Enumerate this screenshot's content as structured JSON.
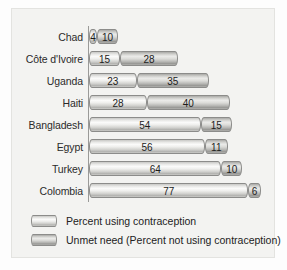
{
  "chart_data": {
    "type": "bar",
    "orientation": "horizontal",
    "stacked": true,
    "title": "",
    "subtitle": "",
    "xlabel": "",
    "ylabel": "",
    "xlim": [
      0,
      90
    ],
    "grid": false,
    "legend_position": "bottom-left",
    "categories": [
      "Chad",
      "Côte d'Ivoire",
      "Uganda",
      "Haiti",
      "Bangladesh",
      "Egypt",
      "Turkey",
      "Colombia"
    ],
    "series": [
      {
        "name": "Percent using contraception",
        "color": "#e6e6e3",
        "values": [
          4,
          15,
          23,
          28,
          54,
          56,
          64,
          77
        ]
      },
      {
        "name": "Unmet need (Percent not using contraception)",
        "color": "#c0c0bd",
        "values": [
          10,
          28,
          35,
          40,
          15,
          11,
          10,
          6
        ]
      }
    ],
    "rows": [
      {
        "label": "Chad",
        "using": 4,
        "unmet": 10,
        "using_text": "4",
        "unmet_text": "10"
      },
      {
        "label": "Côte d'Ivoire",
        "using": 15,
        "unmet": 28,
        "using_text": "15",
        "unmet_text": "28"
      },
      {
        "label": "Uganda",
        "using": 23,
        "unmet": 35,
        "using_text": "23",
        "unmet_text": "35"
      },
      {
        "label": "Haiti",
        "using": 28,
        "unmet": 40,
        "using_text": "28",
        "unmet_text": "40"
      },
      {
        "label": "Bangladesh",
        "using": 54,
        "unmet": 15,
        "using_text": "54",
        "unmet_text": "15"
      },
      {
        "label": "Egypt",
        "using": 56,
        "unmet": 11,
        "using_text": "56",
        "unmet_text": "11"
      },
      {
        "label": "Turkey",
        "using": 64,
        "unmet": 10,
        "using_text": "64",
        "unmet_text": "10"
      },
      {
        "label": "Colombia",
        "using": 77,
        "unmet": 6,
        "using_text": "77",
        "unmet_text": "6"
      }
    ]
  },
  "legend": {
    "items": [
      {
        "label": "Percent using contraception",
        "series": "using"
      },
      {
        "label": "Unmet need (Percent not using contraception)",
        "series": "unmet"
      }
    ]
  },
  "style": {
    "background": "#f3f3f1",
    "axis_color": "#9a9a98",
    "bar_border": "#8c8c8a",
    "text_color": "#2b2b2b",
    "px_per_unit": 2.07,
    "row_height": 22,
    "bar_height": 15
  }
}
